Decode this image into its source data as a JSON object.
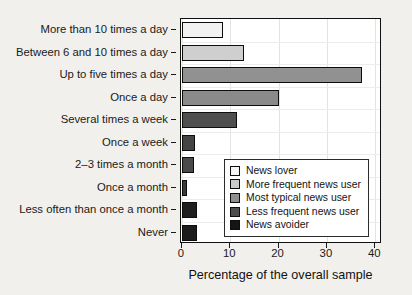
{
  "chart_data": {
    "type": "bar",
    "orientation": "horizontal",
    "title": "",
    "xlabel": "Percentage of the overall sample",
    "ylabel": "",
    "xlim": [
      0,
      41.2
    ],
    "xticks": [
      0,
      10,
      20,
      30,
      40
    ],
    "xtick_labels": [
      "0",
      "10",
      "20",
      "30",
      "40"
    ],
    "grid": true,
    "grid_orientation": "vertical",
    "legend_position": "center-right-inside",
    "categories": [
      "More than 10 times a day",
      "Between 6 and 10 times a day",
      "Up to five times a day",
      "Once a day",
      "Several times a week",
      "Once a week",
      "2–3 times a month",
      "Once a month",
      "Less often than once a month",
      "Never"
    ],
    "values": [
      8.4,
      12.9,
      37.3,
      20.1,
      11.3,
      2.7,
      2.5,
      1.0,
      3.2,
      3.2
    ],
    "bar_colors": [
      "#f2f2f2",
      "#cfcfcf",
      "#919191",
      "#8a8a8a",
      "#4f4f4f",
      "#444444",
      "#4a4a4a",
      "#3a3a3a",
      "#1f1f1f",
      "#1c1c1c"
    ],
    "legend": [
      {
        "label": "News lover",
        "color": "#f5f5f5"
      },
      {
        "label": "More frequent news user",
        "color": "#c9c9c9"
      },
      {
        "label": "Most typical news user",
        "color": "#8f8f8f"
      },
      {
        "label": "Less frequent news user",
        "color": "#4d4d4d"
      },
      {
        "label": "News avoider",
        "color": "#151515"
      }
    ]
  },
  "colors": {
    "page_background": "#f1f0ec",
    "plot_background": "#ffffff",
    "axis": "#111111",
    "gridline": "#e3e3e3",
    "text": "#1a1a1a"
  }
}
